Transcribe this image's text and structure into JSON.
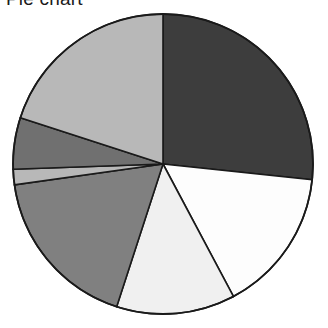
{
  "chart_data": {
    "type": "pie",
    "title": "Pie chart",
    "xlabel": "",
    "ylabel": "",
    "grid": false,
    "legend": "none",
    "start_angle_deg": 0,
    "direction": "clockwise",
    "center": {
      "cx": 163,
      "cy": 164,
      "r": 150
    },
    "categories": [
      "Slice 1",
      "Slice 2",
      "Slice 3",
      "Slice 4",
      "Slice 5",
      "Slice 6",
      "Slice 7"
    ],
    "values": [
      26.7,
      15.6,
      12.8,
      17.8,
      1.7,
      5.6,
      19.8
    ],
    "angles_deg": [
      96,
      56,
      46,
      64,
      6,
      20,
      72
    ],
    "colors": [
      "#3d3d3d",
      "#fdfdfd",
      "#f0f0f0",
      "#808080",
      "#b8b8b8",
      "#707070",
      "#b8b8b8"
    ],
    "edge_color": "#1a1a1a",
    "slices": [
      {
        "label": "Slice 1",
        "value": 26.7,
        "angle_deg": 96,
        "start_deg": 0,
        "end_deg": 96,
        "color": "#3d3d3d"
      },
      {
        "label": "Slice 2",
        "value": 15.6,
        "angle_deg": 56,
        "start_deg": 96,
        "end_deg": 152,
        "color": "#fdfdfd"
      },
      {
        "label": "Slice 3",
        "value": 12.8,
        "angle_deg": 46,
        "start_deg": 152,
        "end_deg": 198,
        "color": "#f0f0f0"
      },
      {
        "label": "Slice 4",
        "value": 17.8,
        "angle_deg": 64,
        "start_deg": 198,
        "end_deg": 262,
        "color": "#808080"
      },
      {
        "label": "Slice 5",
        "value": 1.7,
        "angle_deg": 6,
        "start_deg": 262,
        "end_deg": 268,
        "color": "#b8b8b8"
      },
      {
        "label": "Slice 6",
        "value": 5.6,
        "angle_deg": 20,
        "start_deg": 268,
        "end_deg": 288,
        "color": "#707070"
      },
      {
        "label": "Slice 7",
        "value": 19.8,
        "angle_deg": 72,
        "start_deg": 288,
        "end_deg": 360,
        "color": "#b8b8b8"
      }
    ]
  },
  "figure": {
    "title": "Pie chart",
    "background": "#ffffff"
  }
}
